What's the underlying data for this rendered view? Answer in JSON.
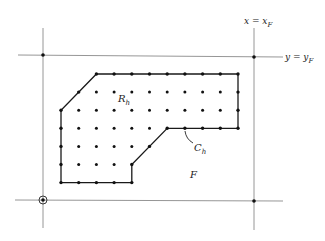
{
  "diagram": {
    "type": "finite-difference grid over region",
    "labels": {
      "vertical_line": {
        "lhs": "x = x",
        "sub": "F"
      },
      "horizontal_line": {
        "lhs": "y = y",
        "sub": "F"
      },
      "region": {
        "main": "R",
        "sub": "h"
      },
      "curve": {
        "main": "C",
        "sub": "h"
      },
      "outer": {
        "main": "F"
      }
    },
    "grid": {
      "columns": 11,
      "rows": 7,
      "boundary_polygon": [
        [
          2,
          0
        ],
        [
          10,
          0
        ],
        [
          10,
          3
        ],
        [
          6,
          3
        ],
        [
          4,
          5
        ],
        [
          4,
          6
        ],
        [
          0,
          6
        ],
        [
          0,
          2
        ]
      ],
      "boundary_points": [
        [
          2,
          0
        ],
        [
          3,
          0
        ],
        [
          4,
          0
        ],
        [
          5,
          0
        ],
        [
          6,
          0
        ],
        [
          7,
          0
        ],
        [
          8,
          0
        ],
        [
          9,
          0
        ],
        [
          10,
          0
        ],
        [
          1,
          1
        ],
        [
          10,
          1
        ],
        [
          0,
          2
        ],
        [
          10,
          2
        ],
        [
          0,
          3
        ],
        [
          6,
          3
        ],
        [
          7,
          3
        ],
        [
          8,
          3
        ],
        [
          9,
          3
        ],
        [
          10,
          3
        ],
        [
          0,
          4
        ],
        [
          5,
          4
        ],
        [
          0,
          5
        ],
        [
          4,
          5
        ],
        [
          0,
          6
        ],
        [
          1,
          6
        ],
        [
          2,
          6
        ],
        [
          3,
          6
        ],
        [
          4,
          6
        ]
      ],
      "interior_points": [
        [
          2,
          1
        ],
        [
          3,
          1
        ],
        [
          4,
          1
        ],
        [
          5,
          1
        ],
        [
          6,
          1
        ],
        [
          7,
          1
        ],
        [
          8,
          1
        ],
        [
          9,
          1
        ],
        [
          1,
          2
        ],
        [
          2,
          2
        ],
        [
          3,
          2
        ],
        [
          4,
          2
        ],
        [
          5,
          2
        ],
        [
          6,
          2
        ],
        [
          7,
          2
        ],
        [
          8,
          2
        ],
        [
          9,
          2
        ],
        [
          1,
          3
        ],
        [
          2,
          3
        ],
        [
          3,
          3
        ],
        [
          4,
          3
        ],
        [
          5,
          3
        ],
        [
          1,
          4
        ],
        [
          2,
          4
        ],
        [
          3,
          4
        ],
        [
          4,
          4
        ],
        [
          1,
          5
        ],
        [
          2,
          5
        ],
        [
          3,
          5
        ]
      ]
    },
    "frame_corner_points": [
      "top-left",
      "top-right",
      "bottom-right"
    ],
    "origin_marker": "bottom-left"
  }
}
